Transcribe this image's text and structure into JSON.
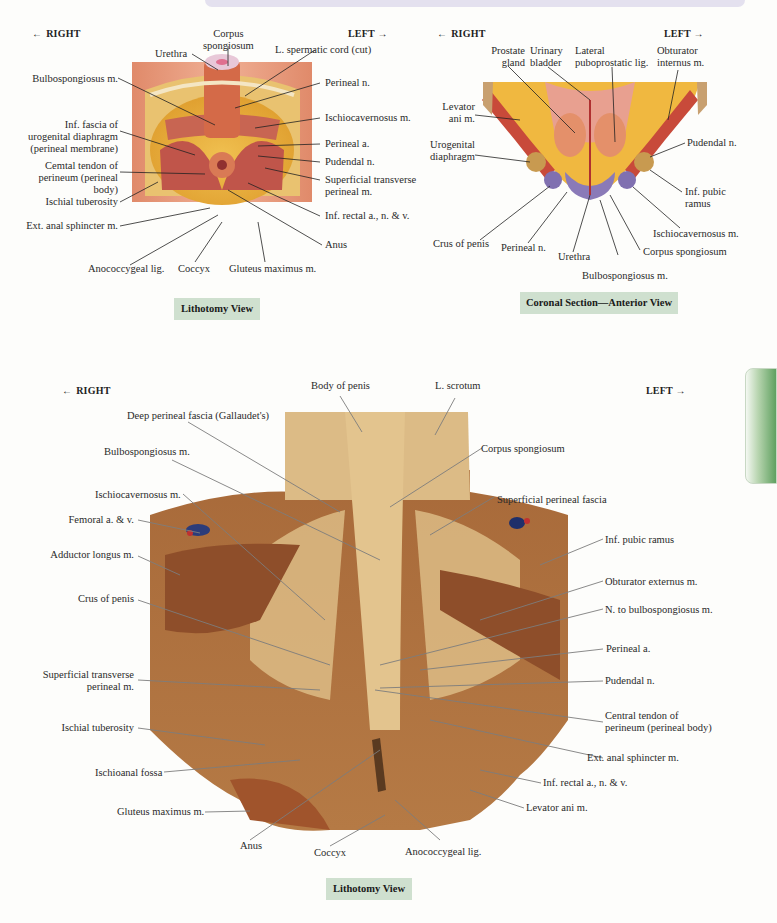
{
  "page": {
    "accent_tab_color": "#5fa060",
    "caption_bg": "#cfe0cf"
  },
  "figure_a": {
    "dir_right": "RIGHT",
    "dir_left": "LEFT",
    "caption": "Lithotomy View",
    "labels": {
      "corpus_spongiosum": "Corpus\nspongiosum",
      "urethra": "Urethra",
      "spermatic_cord": "L. spermatic cord (cut)",
      "bulbospongiosus": "Bulbospongiosus m.",
      "perineal_n": "Perineal n.",
      "inf_fascia": "Inf. fascia of\nurogenital diaphragm\n(perineal membrane)",
      "ischiocavernosus": "Ischiocavernosus m.",
      "perineal_a": "Perineal a.",
      "central_tendon": "Cemtal tendon of\nperineum (perineal\nbody)",
      "pudendal_n": "Pudendal n.",
      "superficial_transverse": "Superficial transverse\nperineal m.",
      "ischial_tuberosity": "Ischial tuberosity",
      "inf_rectal": "Inf. rectal a., n. & v.",
      "ext_anal": "Ext. anal sphincter m.",
      "anus": "Anus",
      "anococcygeal": "Anococcygeal lig.",
      "coccyx": "Coccyx",
      "gluteus": "Gluteus maximus m."
    }
  },
  "figure_b": {
    "dir_right": "RIGHT",
    "dir_left": "LEFT",
    "caption": "Coronal Section—Anterior View",
    "labels": {
      "prostate": "Prostate\ngland",
      "bladder": "Urinary\nbladder",
      "puboprostatic": "Lateral\npuboprostatic lig.",
      "obturator_internus": "Obturator\ninternus m.",
      "levator_ani": "Levator\nani m.",
      "urogenital": "Urogenital\ndiaphragm",
      "pudendal_n": "Pudendal n.",
      "inf_pubic_ramus": "Inf. pubic\nramus",
      "ischiocavernosus": "Ischiocavernosus m.",
      "crus": "Crus of penis",
      "perineal_n": "Perineal n.",
      "urethra": "Urethra",
      "corpus_spongiosum": "Corpus spongiosum",
      "bulbospongiosus": "Bulbospongiosus m."
    }
  },
  "figure_c": {
    "dir_right": "RIGHT",
    "dir_left": "LEFT",
    "caption": "Lithotomy View",
    "labels": {
      "body_of_penis": "Body of penis",
      "l_scrotum": "L. scrotum",
      "deep_fascia": "Deep perineal fascia (Gallaudet's)",
      "bulbospongiosus": "Bulbospongiosus m.",
      "corpus_spongiosum": "Corpus spongiosum",
      "ischiocavernosus": "Ischiocavernosus m.",
      "superficial_fascia": "Superficial perineal fascia",
      "femoral": "Femoral a. & v.",
      "adductor": "Adductor longus m.",
      "inf_pubic_ramus": "Inf. pubic ramus",
      "obturator_externus": "Obturator externus m.",
      "crus": "Crus of penis",
      "n_bulbospongiosus": "N. to bulbospongiosus m.",
      "perineal_a": "Perineal a.",
      "superficial_transverse": "Superficial transverse\nperineal m.",
      "pudendal_n": "Pudendal n.",
      "central_tendon": "Central tendon of\nperineum (perineal body)",
      "ischial_tuberosity": "Ischial tuberosity",
      "ext_anal": "Ext. anal sphincter m.",
      "ischioanal": "Ischioanal fossa",
      "inf_rectal": "Inf. rectal a., n. & v.",
      "gluteus": "Gluteus maximus m.",
      "levator_ani": "Levator ani m.",
      "anus": "Anus",
      "coccyx": "Coccyx",
      "anococcygeal": "Anococcygeal lig."
    }
  }
}
